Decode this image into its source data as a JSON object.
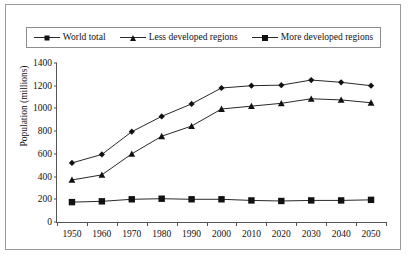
{
  "chart_data": {
    "type": "line",
    "title": "",
    "xlabel": "",
    "ylabel": "Population (millions)",
    "categories": [
      "1950",
      "1960",
      "1970",
      "1980",
      "1990",
      "2000",
      "2010",
      "2020",
      "2030",
      "2040",
      "2050"
    ],
    "x": [
      1950,
      1960,
      1970,
      1980,
      1990,
      2000,
      2010,
      2020,
      2030,
      2040,
      2050
    ],
    "ylim": [
      0,
      1400
    ],
    "yticks": [
      0,
      200,
      400,
      600,
      800,
      1000,
      1200,
      1400
    ],
    "grid": false,
    "legend_position": "top",
    "series": [
      {
        "name": "World total",
        "marker": "diamond",
        "color": "#111111",
        "values": [
          520,
          595,
          795,
          930,
          1040,
          1180,
          1200,
          1205,
          1250,
          1230,
          1200
        ]
      },
      {
        "name": "Less developed regions",
        "marker": "triangle",
        "color": "#111111",
        "values": [
          370,
          415,
          600,
          755,
          845,
          995,
          1020,
          1045,
          1085,
          1075,
          1050
        ]
      },
      {
        "name": "More developed regions",
        "marker": "square",
        "color": "#111111",
        "values": [
          175,
          182,
          200,
          205,
          200,
          200,
          190,
          185,
          190,
          190,
          195
        ]
      }
    ]
  },
  "legend": {
    "entries": [
      {
        "label": "World total",
        "marker": "diamond"
      },
      {
        "label": "Less developed regions",
        "marker": "triangle"
      },
      {
        "label": "More developed regions",
        "marker": "square"
      }
    ]
  },
  "axis": {
    "y_title": "Population (millions)"
  }
}
